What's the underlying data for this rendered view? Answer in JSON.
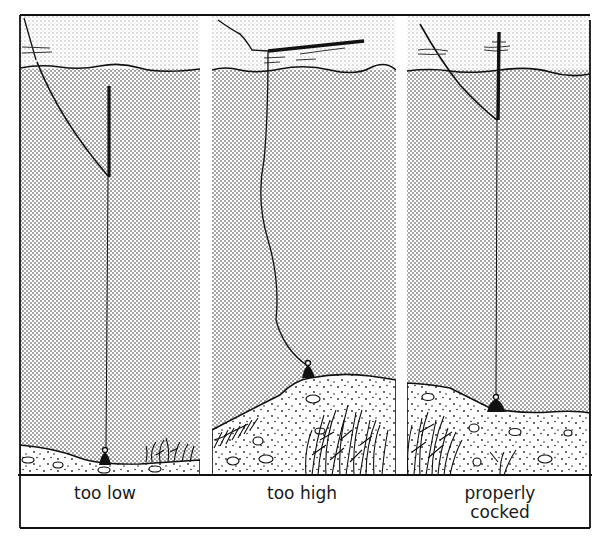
{
  "figure": {
    "type": "illustration",
    "colors": {
      "ink": "#111111",
      "water_stipple": "#8a8a8a",
      "surface_band": "#e6e6e6",
      "paper": "#ffffff"
    }
  },
  "panels": [
    {
      "id": "too-low",
      "label": "too low",
      "float_state": "upright, too low (float top well below surface)"
    },
    {
      "id": "too-high",
      "label": "too high",
      "float_state": "lying flat on surface, line slack"
    },
    {
      "id": "properly-cocked",
      "label": "properly cocked",
      "label_lines": [
        "properly",
        "cocked"
      ],
      "float_state": "upright, tip just above surface"
    }
  ]
}
